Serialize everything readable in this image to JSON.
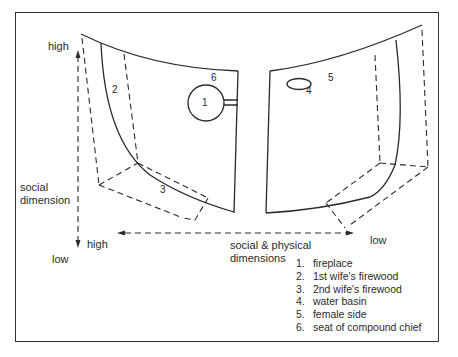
{
  "figure": {
    "type": "compound room layout diagram",
    "axes": {
      "vertical": {
        "label": "social dimension",
        "top_label": "high",
        "bottom_label": "low"
      },
      "horizontal": {
        "label_line1": "social & physical",
        "label_line2": "dimensions",
        "left_label": "high",
        "right_label": "low"
      }
    },
    "markers": [
      {
        "id": "1",
        "text": "1"
      },
      {
        "id": "2",
        "text": "2"
      },
      {
        "id": "3",
        "text": "3"
      },
      {
        "id": "4",
        "text": "4"
      },
      {
        "id": "5",
        "text": "5"
      },
      {
        "id": "6",
        "text": "6"
      }
    ],
    "legend": [
      {
        "num": "1.",
        "text": "fireplace"
      },
      {
        "num": "2.",
        "text": "1st wife's firewood"
      },
      {
        "num": "3.",
        "text": "2nd wife's firewood"
      },
      {
        "num": "4.",
        "text": "water basin"
      },
      {
        "num": "5.",
        "text": "female side"
      },
      {
        "num": "6.",
        "text": "seat of compound chief"
      }
    ],
    "colors": {
      "line": "#2a2a2a",
      "background": "#ffffff"
    }
  }
}
